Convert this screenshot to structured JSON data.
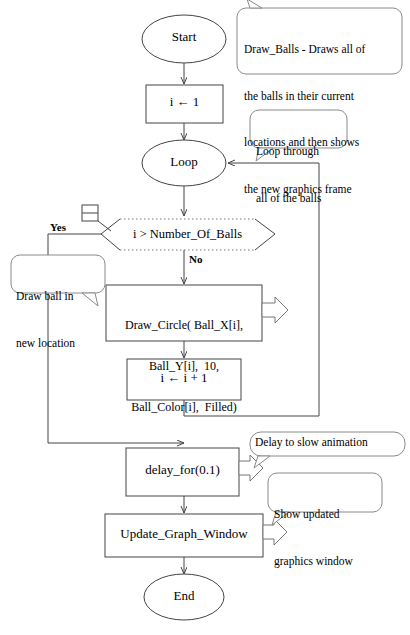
{
  "diagram": {
    "colors": {
      "stroke": "#444444",
      "text": "#000000",
      "background": "#ffffff",
      "callout_stroke": "#8a8a8a"
    },
    "nodes": {
      "start": {
        "label": "Start",
        "shape": "terminator-ellipse"
      },
      "init": {
        "label": "i ← 1",
        "shape": "process-rect"
      },
      "loop": {
        "label": "Loop",
        "shape": "terminator-ellipse"
      },
      "decision": {
        "label": "i > Number_Of_Balls",
        "shape": "decision-hexagon"
      },
      "draw_circle": {
        "line1": "Draw_Circle( Ball_X[i],",
        "line2": "Ball_Y[i],  10,",
        "line3": "Ball_Color[i],  Filled)",
        "shape": "process-rect"
      },
      "increment": {
        "label": "i ← i + 1",
        "shape": "process-rect"
      },
      "delay": {
        "label": "delay_for(0.1)",
        "shape": "process-rect"
      },
      "update_window": {
        "label": "Update_Graph_Window",
        "shape": "process-rect"
      },
      "end": {
        "label": "End",
        "shape": "terminator-ellipse"
      }
    },
    "branch_labels": {
      "yes": "Yes",
      "no": "No"
    },
    "callouts": {
      "draw_balls": {
        "line1": "Draw_Balls - Draws all of",
        "line2": "the balls in their current",
        "line3": "locations and then shows",
        "line4": "the new graphics frame"
      },
      "loop_through": {
        "line1": "Loop through",
        "line2": "all of the balls"
      },
      "draw_ball_location": {
        "line1": "Draw ball in",
        "line2": "new location"
      },
      "delay_note": {
        "line1": "Delay to slow animation"
      },
      "show_updated": {
        "line1": "Show updated",
        "line2": "graphics window"
      }
    }
  }
}
